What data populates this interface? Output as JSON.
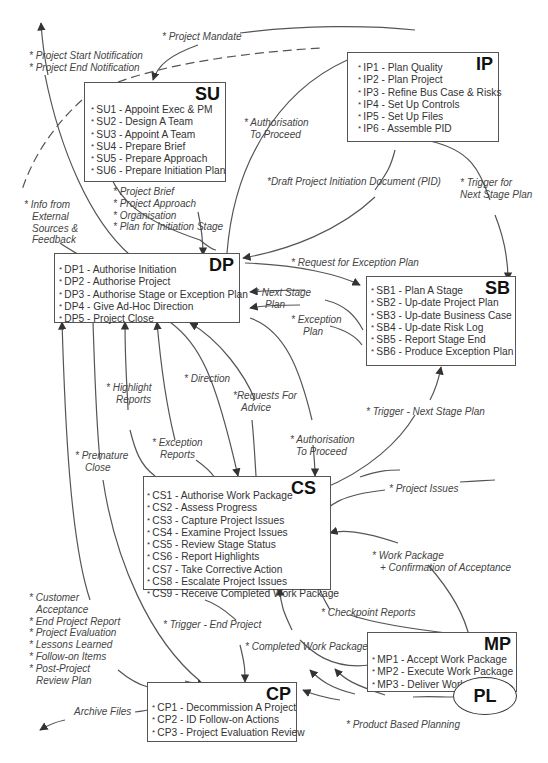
{
  "diagram": {
    "type": "process-flow",
    "processes": {
      "su": {
        "code": "SU",
        "items": [
          "SU1 - Appoint Exec & PM",
          "SU2 - Design A Team",
          "SU3 - Appoint A Team",
          "SU4 - Prepare Brief",
          "SU5 - Prepare Approach",
          "SU6 - Prepare Initiation Plan"
        ]
      },
      "ip": {
        "code": "IP",
        "items": [
          "IP1 - Plan Quality",
          "IP2 - Plan Project",
          "IP3 - Refine Bus Case & Risks",
          "IP4 - Set Up Controls",
          "IP5 - Set Up Files",
          "IP6 - Assemble PID"
        ]
      },
      "dp": {
        "code": "DP",
        "items": [
          "DP1 - Authorise Initiation",
          "DP2 - Authorise Project",
          "DP3 - Authorise Stage or Exception Plan",
          "DP4 - Give Ad-Hoc Direction",
          "DP5 - Project Close"
        ]
      },
      "sb": {
        "code": "SB",
        "items": [
          "SB1 - Plan A Stage",
          "SB2 - Up-date Project Plan",
          "SB3 - Up-date Business Case",
          "SB4 - Up-date Risk Log",
          "SB5 - Report Stage End",
          "SB6 - Produce Exception Plan"
        ]
      },
      "cs": {
        "code": "CS",
        "items": [
          "CS1 - Authorise Work Package",
          "CS2 - Assess Progress",
          "CS3 - Capture Project Issues",
          "CS4 - Examine Project Issues",
          "CS5 - Review Stage Status",
          "CS6 - Report Highlights",
          "CS7 - Take Corrective Action",
          "CS8 - Escalate Project Issues",
          "CS9 - Receive Completed Work Package"
        ]
      },
      "mp": {
        "code": "MP",
        "items": [
          "MP1 - Accept Work Package",
          "MP2 - Execute Work Package",
          "MP3 - Deliver Work Package"
        ]
      },
      "cp": {
        "code": "CP",
        "items": [
          "CP1 - Decommission A Project",
          "CP2 - ID Follow-on Actions",
          "CP3 - Project Evaluation Review"
        ]
      },
      "pl": {
        "code": "PL"
      }
    },
    "flows": {
      "project_mandate": "* Project Mandate",
      "start_notification": "* Project Start Notification",
      "end_notification": "* Project End Notification",
      "info_external_1": "* Info from",
      "info_external_2": "External",
      "info_external_3": "Sources &",
      "info_external_4": "Feedback",
      "brief_1": "* Project Brief",
      "brief_2": "* Project Approach",
      "brief_3": "*  Organisation",
      "brief_4": "* Plan for Initiation Stage",
      "auth_proceed_top_1": "* Authorisation",
      "auth_proceed_top_2": "To Proceed",
      "draft_pid": "*Draft Project Initiation Document (PID)",
      "trigger_next_1": "* Trigger for",
      "trigger_next_2": "Next Stage Plan",
      "request_exception": "* Request for Exception Plan",
      "next_stage_plan_1": "* Next Stage",
      "next_stage_plan_2": "Plan",
      "exception_plan_1": "* Exception",
      "exception_plan_2": "Plan",
      "highlight_1": "* Highlight",
      "highlight_2": "Reports",
      "direction": "* Direction",
      "requests_advice_1": "*Requests For",
      "requests_advice_2": "Advice",
      "exception_reports_1": "* Exception",
      "exception_reports_2": "Reports",
      "premature_1": "* Premature",
      "premature_2": "Close",
      "auth_proceed_mid_1": "* Authorisation",
      "auth_proceed_mid_2": "To Proceed",
      "trigger_next_stage": "* Trigger - Next Stage Plan",
      "project_issues": "* Project Issues",
      "work_package_1": "* Work Package",
      "work_package_2": "+ Confirmation of Acceptance",
      "checkpoint": "* Checkpoint Reports",
      "completed_wp": "* Completed Work Package",
      "trigger_end": "* Trigger - End Project",
      "closure_1": "* Customer",
      "closure_2": "Acceptance",
      "closure_3": "* End Project Report",
      "closure_4": "* Project Evaluation",
      "closure_5": "* Lessons Learned",
      "closure_6": "* Follow-on Items",
      "closure_7": "* Post-Project",
      "closure_8": "Review Plan",
      "archive": "Archive Files",
      "pbp": "* Product Based Planning"
    }
  }
}
